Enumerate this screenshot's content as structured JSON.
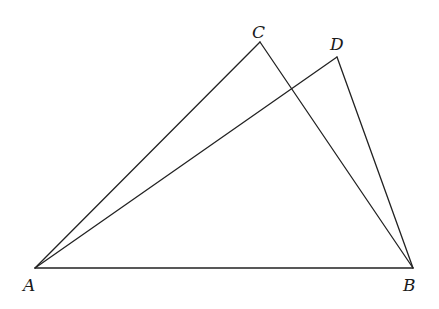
{
  "diagram": {
    "type": "geometry",
    "points": {
      "A": {
        "label": "A",
        "x": 35,
        "y": 268
      },
      "B": {
        "label": "B",
        "x": 413,
        "y": 268
      },
      "C": {
        "label": "C",
        "x": 260,
        "y": 42
      },
      "D": {
        "label": "D",
        "x": 337,
        "y": 57
      }
    },
    "segments": [
      [
        "A",
        "B"
      ],
      [
        "A",
        "C"
      ],
      [
        "C",
        "B"
      ],
      [
        "A",
        "D"
      ],
      [
        "D",
        "B"
      ]
    ],
    "labels": {
      "A": "A",
      "B": "B",
      "C": "C",
      "D": "D"
    },
    "stroke_color": "#222222"
  }
}
